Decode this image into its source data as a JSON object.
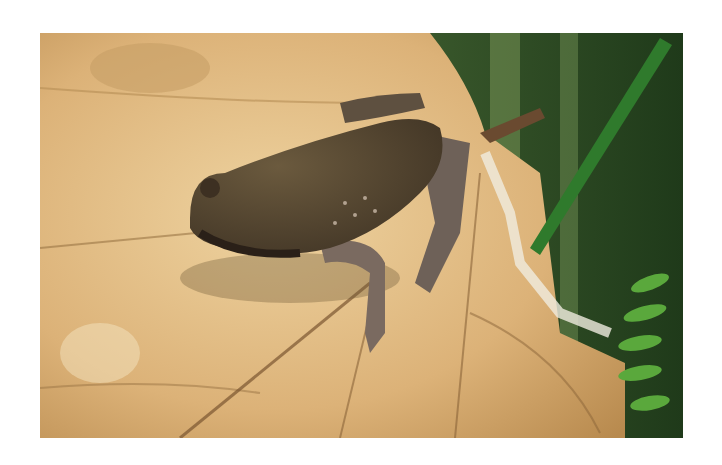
{
  "image": {
    "subject": "frog on dry leaf",
    "alt": "Brown frog resting on a dried leaf with green grass and fern in background"
  },
  "colors": {
    "page_background": "#ffffff",
    "leaf_light": "#e8c68e",
    "leaf_mid": "#d4a56a",
    "leaf_dark": "#a77b44",
    "frog_body": "#5a4a34",
    "frog_shadow": "#3b2e22",
    "frog_limb": "#7a6a60",
    "grass_green": "#2f7a2c",
    "background_green": "#4d6b3a",
    "fern_green": "#5aa83c"
  }
}
